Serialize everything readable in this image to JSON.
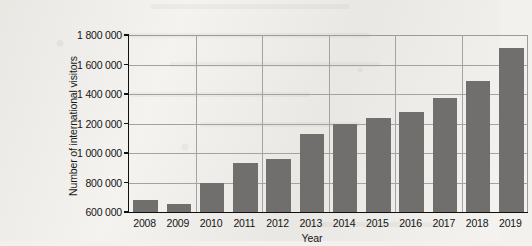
{
  "chart_data": {
    "type": "bar",
    "title": "",
    "subtitle": "",
    "xlabel": "Year",
    "ylabel": "Number of international visitors",
    "categories": [
      "2008",
      "2009",
      "2010",
      "2011",
      "2012",
      "2013",
      "2014",
      "2015",
      "2016",
      "2017",
      "2018",
      "2019"
    ],
    "values": [
      680000,
      655000,
      800000,
      930000,
      960000,
      1130000,
      1200000,
      1235000,
      1280000,
      1375000,
      1485000,
      1710000
    ],
    "ylim": [
      600000,
      1800000
    ],
    "ytick_values": [
      600000,
      800000,
      1000000,
      1200000,
      1400000,
      1600000,
      1800000
    ],
    "ytick_labels": [
      "600 000",
      "800 000",
      "1 000 000",
      "1 200 000",
      "1 400 000",
      "1 600 000",
      "1 800 000"
    ],
    "grid": "horizontal-and-vertical",
    "legend": "none",
    "bar_color": "#706f6d",
    "grid_color": "#a3a3a3",
    "axis_color": "#111111",
    "background_color": "#f3f2ef"
  }
}
